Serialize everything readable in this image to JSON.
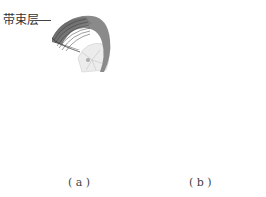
{
  "labels": {
    "belt_layer": "带束层",
    "caption_a": "( a )",
    "caption_b": "( b )"
  },
  "figures": [
    {
      "id": "a",
      "description": "Tire with belt layer (3D view) and cross-section with tall crown profile"
    },
    {
      "id": "b",
      "description": "Tire (3D view) and cross-section with flatter, wider profile"
    }
  ],
  "colors": {
    "inner_dark": "#6e6e6e",
    "inner_light": "#9a9a9a",
    "casing": "#cfcfcf",
    "outline": "#7a7a7a",
    "valve": "#8a8a8a"
  }
}
